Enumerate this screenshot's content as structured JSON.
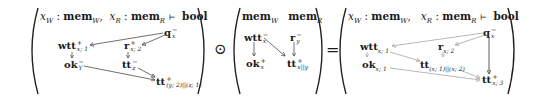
{
  "left_diagram": {
    "header": {
      "x_w": "x",
      "x_w_sub": "W",
      "mem_w": "mem",
      "mem_w_sub": "W",
      "comma": ",",
      "x_r": "x",
      "x_r_sub": "R",
      "mem_r": "mem",
      "mem_r_sub": "R",
      "turnstile": "⊢",
      "result_type": "bool",
      "colon": ":"
    },
    "nodes": {
      "q": {
        "label": "q",
        "sup": "−",
        "sub": "x"
      },
      "wtt": {
        "label": "wtt",
        "sup": "+",
        "sub": "x; 1"
      },
      "r": {
        "label": "r",
        "sup": "+",
        "sub": "x; 2"
      },
      "ok": {
        "label": "ok",
        "sup": "−",
        "sub": "Y"
      },
      "tt_mid": {
        "label": "tt",
        "sup": "−",
        "sub": "z"
      },
      "tt_out": {
        "label": "tt",
        "sup": "+",
        "sub": "(y; 2)||(z; 1)"
      }
    }
  },
  "operator_odot": "⊙",
  "middle_diagram": {
    "header": {
      "mem_w": "mem",
      "mem_w_sub": "W",
      "mem_r": "mem",
      "mem_r_sub": "R"
    },
    "nodes": {
      "wtt": {
        "label": "wtt",
        "sup": "−",
        "sub": "x"
      },
      "r": {
        "label": "r",
        "sup": "−",
        "sub": "y"
      },
      "ok": {
        "label": "ok",
        "sup": "+",
        "sub": "x"
      },
      "tt": {
        "label": "tt",
        "sup": "+",
        "sub": "x||y"
      }
    }
  },
  "operator_equals": "=",
  "right_diagram": {
    "header": {
      "x_w": "x",
      "x_w_sub": "W",
      "mem_w": "mem",
      "mem_w_sub": "W",
      "comma": ",",
      "x_r": "x",
      "x_r_sub": "R",
      "mem_r": "mem",
      "mem_r_sub": "R",
      "turnstile": "⊢",
      "result_type": "bool",
      "colon": ":"
    },
    "nodes": {
      "q": {
        "label": "q",
        "sup": "−",
        "sub": "x"
      },
      "wtt": {
        "label": "wtt",
        "sup": "",
        "sub": "x; 1"
      },
      "r": {
        "label": "r",
        "sup": "",
        "sub": "x; 2"
      },
      "ok": {
        "label": "ok",
        "sup": "",
        "sub": "x; 1"
      },
      "tt_mid": {
        "label": "tt",
        "sup": "",
        "sub": "(x; 1)||(x; 2)"
      },
      "tt_out": {
        "label": "tt",
        "sup": "+",
        "sub": "x; 3"
      }
    }
  },
  "colors": {
    "ink": "#1a1a1a",
    "wire_dark": "#333333",
    "wire_light": "#9a9a9a"
  }
}
